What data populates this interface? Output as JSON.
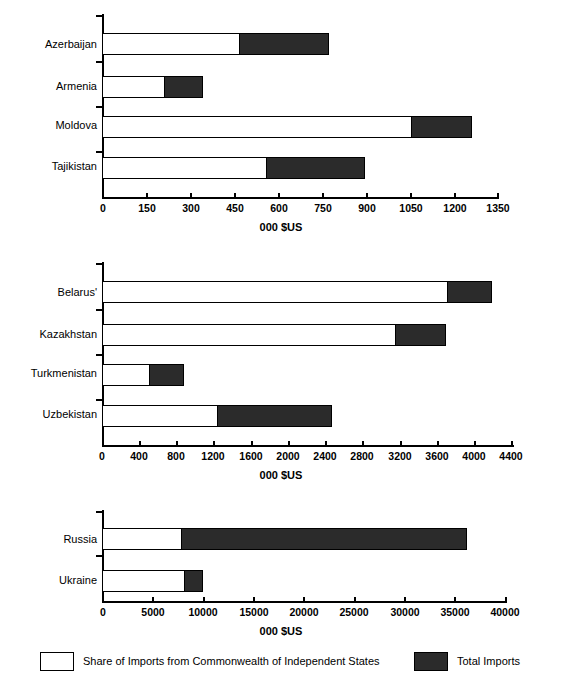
{
  "chart_data": [
    {
      "type": "bar",
      "orientation": "horizontal",
      "title": "",
      "xlabel": "000 $US",
      "ylabel": "",
      "xlim": [
        0,
        1350
      ],
      "xticks": [
        0,
        150,
        300,
        450,
        600,
        750,
        900,
        1050,
        1200,
        1350
      ],
      "xticklabels": [
        "0",
        "150",
        "300",
        "450",
        "600",
        "750",
        "900",
        "1050",
        "1200",
        "1350"
      ],
      "categories": [
        "Azerbaijan",
        "Armenia",
        "Moldova",
        "Tajikistan"
      ],
      "series": [
        {
          "name": "Total Imports",
          "values": [
            777,
            345,
            1263,
            898
          ]
        },
        {
          "name": "Share of Imports from Commonwealth of Independent States",
          "values": [
            470,
            215,
            1060,
            563
          ]
        }
      ],
      "grid": false,
      "legend_position": "bottom"
    },
    {
      "type": "bar",
      "orientation": "horizontal",
      "title": "",
      "xlabel": "000 $US",
      "ylabel": "",
      "xlim": [
        0,
        4400
      ],
      "xticks": [
        0,
        400,
        800,
        1200,
        1600,
        2000,
        2400,
        2800,
        3200,
        3600,
        4000,
        4400
      ],
      "xticklabels": [
        "0",
        "400",
        "800",
        "1200",
        "1600",
        "2000",
        "2400",
        "2800",
        "3200",
        "3600",
        "4000",
        "4400"
      ],
      "categories": [
        "Belarus'",
        "Kazakhstan",
        "Turkmenistan",
        "Uzbekistan"
      ],
      "series": [
        {
          "name": "Total Imports",
          "values": [
            4200,
            3700,
            880,
            2470
          ]
        },
        {
          "name": "Share of Imports from Commonwealth of Independent States",
          "values": [
            3720,
            3160,
            520,
            1250
          ]
        }
      ],
      "grid": false,
      "legend_position": "bottom"
    },
    {
      "type": "bar",
      "orientation": "horizontal",
      "title": "",
      "xlabel": "000 $US",
      "ylabel": "",
      "xlim": [
        0,
        40000
      ],
      "xticks": [
        0,
        5000,
        10000,
        15000,
        20000,
        25000,
        30000,
        35000,
        40000
      ],
      "xticklabels": [
        "0",
        "5000",
        "10000",
        "15000",
        "20000",
        "25000",
        "30000",
        "35000",
        "40000"
      ],
      "categories": [
        "Russia",
        "Ukraine"
      ],
      "series": [
        {
          "name": "Total Imports",
          "values": [
            36200,
            10000
          ]
        },
        {
          "name": "Share of Imports from Commonwealth of Independent States",
          "values": [
            7900,
            8200
          ]
        }
      ],
      "grid": false,
      "legend_position": "bottom"
    }
  ],
  "legend": {
    "share_label": "Share of Imports from Commonwealth of Independent States",
    "total_label": "Total Imports"
  },
  "colors": {
    "total": "#2b2b2b",
    "share": "#ffffff",
    "axis": "#000000"
  }
}
